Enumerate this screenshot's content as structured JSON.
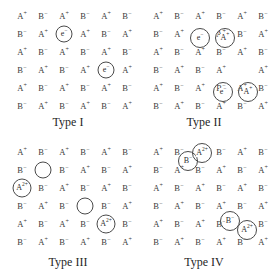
{
  "figure": {
    "ion_colors": {
      "ion_text": "#3a3a3a",
      "circle_stroke": "#4a4a4a",
      "caption": "#1f1f1f",
      "background": "#ffffff"
    },
    "grid": {
      "columns": 6,
      "rows": 6,
      "col_step": 21,
      "row_step": 18,
      "origin_x": 22,
      "origin_y": 14
    },
    "panels": [
      {
        "id": "type-i",
        "caption": "Type I",
        "lattice": [
          [
            "A+",
            "B-",
            "A+",
            "B-",
            "A+",
            "B-"
          ],
          [
            "B-",
            "A+",
            "",
            "A+",
            "B-",
            "A+"
          ],
          [
            "A+",
            "B-",
            "A+",
            "B-",
            "A+",
            "B-"
          ],
          [
            "B-",
            "A+",
            "B-",
            "A+",
            "",
            "A+"
          ],
          [
            "A+",
            "B-",
            "A+",
            "B-",
            "A+",
            "B-"
          ],
          [
            "B-",
            "A+",
            "B-",
            "A+",
            "B-",
            "A+"
          ]
        ],
        "defects": [
          {
            "name": "electron-trap",
            "label": "e-",
            "row": 1,
            "col": 2,
            "dx": 0,
            "dy": 0,
            "r": 8.5
          },
          {
            "name": "electron-trap",
            "label": "e-",
            "row": 3,
            "col": 4,
            "dx": 0,
            "dy": 0,
            "r": 8.5
          }
        ]
      },
      {
        "id": "type-ii",
        "caption": "Type II",
        "lattice": [
          [
            "A+",
            "B-",
            "A+",
            "B-",
            "A+",
            "B-"
          ],
          [
            "B-",
            "A+",
            "",
            "A+",
            "B-",
            "A+"
          ],
          [
            "A+",
            "B-",
            "A+",
            "B-",
            "A+",
            "B-"
          ],
          [
            "B-",
            "A+",
            "B-",
            "A+",
            "",
            "A+"
          ],
          [
            "A+",
            "B-",
            "A+",
            "B-",
            "A+",
            "B-"
          ],
          [
            "B-",
            "A+",
            "B-",
            "A+",
            "B-",
            "A+"
          ]
        ],
        "defects": [
          {
            "name": "electron-trap",
            "label": "e-",
            "row": 1,
            "col": 2,
            "dx": 0,
            "dy": 4,
            "r": 10
          },
          {
            "name": "interstitial-cation",
            "label": "A+",
            "row": 1,
            "col": 3,
            "dx": 4,
            "dy": 4,
            "r": 10
          },
          {
            "name": "electron-trap",
            "label": "e-",
            "row": 4,
            "col": 3,
            "dx": 2,
            "dy": 4,
            "r": 10
          },
          {
            "name": "interstitial-cation",
            "label": "A+",
            "row": 4,
            "col": 4,
            "dx": 6,
            "dy": 4,
            "r": 10
          }
        ]
      },
      {
        "id": "type-iii",
        "caption": "Type III",
        "lattice": [
          [
            "A+",
            "B-",
            "A+",
            "B-",
            "A+",
            "B-"
          ],
          [
            "B-",
            "",
            "B-",
            "A+",
            "B-",
            "A+"
          ],
          [
            "",
            "B-",
            "A+",
            "B-",
            "A+",
            "B-"
          ],
          [
            "B-",
            "A+",
            "B-",
            "",
            "B-",
            "A+"
          ],
          [
            "A+",
            "B-",
            "A+",
            "B-",
            "",
            "B-"
          ],
          [
            "B-",
            "A+",
            "B-",
            "A+",
            "B-",
            "A+"
          ]
        ],
        "defects": [
          {
            "name": "cation-vacancy",
            "label": "",
            "row": 1,
            "col": 1,
            "dx": 0,
            "dy": 0,
            "r": 8.5
          },
          {
            "name": "divalent-cation",
            "label": "A2+",
            "row": 2,
            "col": 0,
            "dx": 0,
            "dy": 0,
            "r": 9.5
          },
          {
            "name": "cation-vacancy",
            "label": "",
            "row": 3,
            "col": 3,
            "dx": 0,
            "dy": 0,
            "r": 8.5
          },
          {
            "name": "divalent-cation",
            "label": "A2+",
            "row": 4,
            "col": 4,
            "dx": 0,
            "dy": 0,
            "r": 9.5
          }
        ]
      },
      {
        "id": "type-iv",
        "caption": "Type IV",
        "lattice": [
          [
            "A+",
            "B-",
            "",
            "B-",
            "A+",
            "B-"
          ],
          [
            "B-",
            "A+",
            "B-",
            "A+",
            "B-",
            "A+"
          ],
          [
            "A+",
            "B-",
            "A+",
            "B-",
            "A+",
            "B-"
          ],
          [
            "B-",
            "A+",
            "B-",
            "A+",
            "B-",
            "A+"
          ],
          [
            "A+",
            "B-",
            "A+",
            "B-",
            "",
            "B-"
          ],
          [
            "B-",
            "A+",
            "B-",
            "A+",
            "B-",
            "A+"
          ]
        ],
        "defects": [
          {
            "name": "anion-interstitial",
            "label": "B-",
            "row": 0,
            "col": 1,
            "dx": 9,
            "dy": 9,
            "r": 10
          },
          {
            "name": "divalent-cation",
            "label": "A2+",
            "row": 0,
            "col": 2,
            "dx": 2,
            "dy": 1,
            "r": 10
          },
          {
            "name": "anion-interstitial",
            "label": "B-",
            "row": 4,
            "col": 3,
            "dx": 9,
            "dy": -3,
            "r": 10
          },
          {
            "name": "divalent-cation",
            "label": "A2+",
            "row": 4,
            "col": 4,
            "dx": 5,
            "dy": 6,
            "r": 10
          }
        ]
      }
    ]
  },
  "chart_data": {
    "type": "diagram",
    "panels": [
      "Type I",
      "Type II",
      "Type III",
      "Type IV"
    ],
    "lattice_species": [
      "A+",
      "B-",
      "A2+",
      "e-"
    ],
    "notes": [
      "Type I: F-centre / electron trapped in anion vacancy (e-)",
      "Type II: Frenkel defect - cation displaced to interstitial site (e- and A+ pair)",
      "Type III: Cation vacancies balanced by divalent cation A2+",
      "Type IV: Divalent cation A2+ with displaced anion B-"
    ]
  }
}
